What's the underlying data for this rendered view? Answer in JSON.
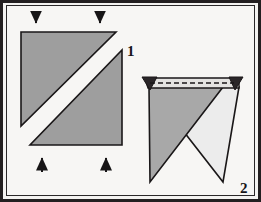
{
  "figure": {
    "background_color": "#f7f6f4",
    "frame_color": "#231f20",
    "outline_color": "#1a1718",
    "paper_front_color": "#9e9e9e",
    "paper_shade_color": "#a8a8a8",
    "paper_back_color": "#ececec",
    "paper_band_color": "#e4e3e1",
    "steps": [
      {
        "number": "1",
        "name": "split-square-step",
        "description": "Square of paper divided by a diagonal white gap into two gray right triangles, pressed from top and bottom",
        "arrows": [
          {
            "name": "arrow-top-left",
            "direction": "down",
            "x": 36,
            "y1": 12,
            "y2": 29
          },
          {
            "name": "arrow-top-right",
            "direction": "down",
            "x": 100,
            "y1": 12,
            "y2": 29
          },
          {
            "name": "arrow-bottom-left",
            "direction": "up",
            "x": 42,
            "y1": 172,
            "y2": 152
          },
          {
            "name": "arrow-bottom-right",
            "direction": "up",
            "x": 106,
            "y1": 172,
            "y2": 152
          }
        ],
        "shapes": [
          {
            "name": "upper-left-triangle",
            "points": "21,32 116,32 21,126",
            "fill": "#9e9e9e"
          },
          {
            "name": "lower-right-triangle",
            "points": "122,50 122,145 30,145",
            "fill": "#9e9e9e"
          }
        ]
      },
      {
        "number": "2",
        "name": "folded-point-step",
        "description": "Folded paper with horizontal dashed fold band across the top and two crossing triangular flaps below",
        "shapes": [
          {
            "name": "top-band",
            "points": "144,79 240,79 240,88 144,88",
            "fill": "#e4e3e1"
          },
          {
            "name": "left-band-tip",
            "points": "142,78 156,78 150,90",
            "fill": "#2a2628"
          },
          {
            "name": "right-band-tip",
            "points": "228,78 242,78 234,90",
            "fill": "#2a2628"
          },
          {
            "name": "right-light-flap",
            "points": "151,88 238,88 224,181 151,88",
            "fill": "#ececec"
          },
          {
            "name": "left-shaded-flap",
            "points": "151,88 224,88 150,181",
            "fill": "#a8a8a8"
          }
        ],
        "fold_line": {
          "name": "dashed-fold-line",
          "x1": 150,
          "y1": 83,
          "x2": 234,
          "y2": 83,
          "style": "dashed"
        }
      }
    ]
  }
}
